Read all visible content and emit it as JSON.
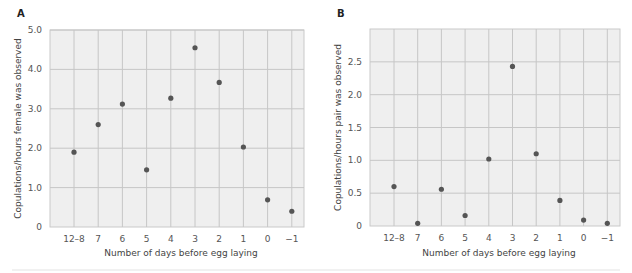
{
  "chart_data": [
    {
      "type": "scatter",
      "panel": "A",
      "title": "",
      "xlabel": "Number of days before egg laying",
      "ylabel": "Copulations/hours female was observed",
      "categories": [
        "12–8",
        "7",
        "6",
        "5",
        "4",
        "3",
        "2",
        "1",
        "0",
        "−1"
      ],
      "values": [
        1.9,
        2.6,
        3.12,
        1.45,
        3.27,
        4.55,
        3.67,
        2.03,
        0.69,
        0.4
      ],
      "ylim": [
        0,
        5.0
      ],
      "yticks": [
        0,
        1.0,
        2.0,
        3.0,
        4.0,
        5.0
      ],
      "ytick_labels": [
        "0",
        "1.0",
        "2.0",
        "3.0",
        "4.0",
        "5.0"
      ],
      "grid": true,
      "legend": "none"
    },
    {
      "type": "scatter",
      "panel": "B",
      "title": "",
      "xlabel": "Number of days before egg laying",
      "ylabel": "Copulations/hours pair was observed",
      "categories": [
        "12–8",
        "7",
        "6",
        "5",
        "4",
        "3",
        "2",
        "1",
        "0",
        "−1"
      ],
      "values": [
        0.6,
        0.04,
        0.56,
        0.16,
        1.02,
        2.43,
        1.1,
        0.39,
        0.09,
        0.04
      ],
      "ylim": [
        0,
        3.0
      ],
      "yticks": [
        0,
        0.5,
        1.0,
        1.5,
        2.0,
        2.5
      ],
      "ytick_labels": [
        "0",
        "0.5",
        "1.0",
        "1.5",
        "2.0",
        "2.5"
      ],
      "grid": true,
      "legend": "none"
    }
  ],
  "colors": {
    "dot": "#555555",
    "plot_background": "#efefef",
    "grid": "#c6c6c6"
  }
}
